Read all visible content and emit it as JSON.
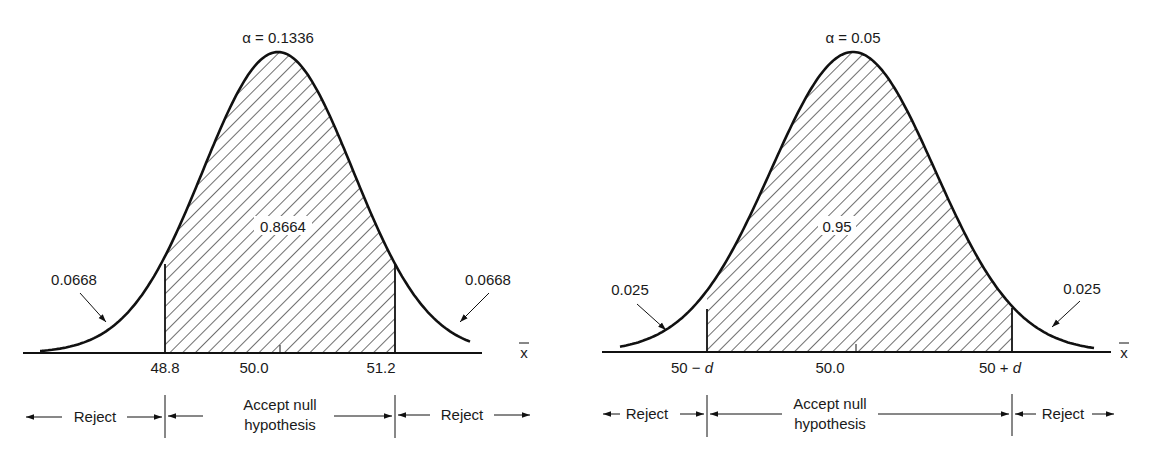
{
  "chart_data": [
    {
      "type": "area",
      "title": "α = 0.1336",
      "distribution": "normal",
      "mean": 50.0,
      "xlabel": "x̄",
      "tick_labels": [
        "48.8",
        "50.0",
        "51.2"
      ],
      "critical_values": [
        48.8,
        51.2
      ],
      "regions": [
        {
          "name": "left-tail",
          "area": 0.0668,
          "label": "0.0668",
          "shaded": false
        },
        {
          "name": "center",
          "area": 0.8664,
          "label": "0.8664",
          "shaded": true
        },
        {
          "name": "right-tail",
          "area": 0.0668,
          "label": "0.0668",
          "shaded": false
        }
      ],
      "decision_labels": [
        "Reject",
        "Accept null hypothesis",
        "Reject"
      ]
    },
    {
      "type": "area",
      "title": "α = 0.05",
      "distribution": "normal",
      "mean": 50.0,
      "xlabel": "x̄",
      "tick_labels": [
        "50 − d",
        "50.0",
        "50 + d"
      ],
      "critical_values": [
        "50 - d",
        "50 + d"
      ],
      "regions": [
        {
          "name": "left-tail",
          "area": 0.025,
          "label": "0.025",
          "shaded": false
        },
        {
          "name": "center",
          "area": 0.95,
          "label": "0.95",
          "shaded": true
        },
        {
          "name": "right-tail",
          "area": 0.025,
          "label": "0.025",
          "shaded": false
        }
      ],
      "decision_labels": [
        "Reject",
        "Accept null hypothesis",
        "Reject"
      ]
    }
  ],
  "left": {
    "alpha": "α = 0.1336",
    "center_area": "0.8664",
    "left_tail": "0.0668",
    "right_tail": "0.0668",
    "tick_left": "48.8",
    "tick_mid": "50.0",
    "tick_right": "51.2",
    "axis_label": "x",
    "reject_left": "Reject",
    "accept_line1": "Accept null",
    "accept_line2": "hypothesis",
    "reject_right": "Reject"
  },
  "right": {
    "alpha": "α = 0.05",
    "center_area": "0.95",
    "left_tail": "0.025",
    "right_tail": "0.025",
    "tick_left_num": "50 − ",
    "tick_left_var": "d",
    "tick_mid": "50.0",
    "tick_right_num": "50 + ",
    "tick_right_var": "d",
    "axis_label": "x",
    "reject_left": "Reject",
    "accept_line1": "Accept null",
    "accept_line2": "hypothesis",
    "reject_right": "Reject"
  }
}
